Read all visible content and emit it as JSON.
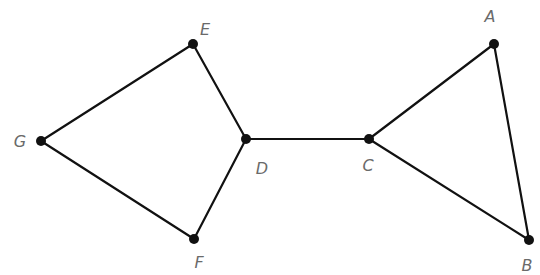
{
  "diagram": {
    "type": "graph",
    "nodes": [
      {
        "id": "A",
        "label": "A",
        "x": 494,
        "y": 44,
        "lx": 490,
        "ly": 22
      },
      {
        "id": "B",
        "label": "B",
        "x": 529,
        "y": 240,
        "lx": 527,
        "ly": 271
      },
      {
        "id": "C",
        "label": "C",
        "x": 369,
        "y": 139,
        "lx": 368,
        "ly": 171
      },
      {
        "id": "D",
        "label": "D",
        "x": 246,
        "y": 139,
        "lx": 262,
        "ly": 174
      },
      {
        "id": "E",
        "label": "E",
        "x": 193,
        "y": 44,
        "lx": 205,
        "ly": 35
      },
      {
        "id": "F",
        "label": "F",
        "x": 194,
        "y": 239,
        "lx": 199,
        "ly": 268
      },
      {
        "id": "G",
        "label": "G",
        "x": 41,
        "y": 141,
        "lx": 20,
        "ly": 147
      }
    ],
    "edges": [
      [
        "G",
        "E"
      ],
      [
        "E",
        "D"
      ],
      [
        "G",
        "F"
      ],
      [
        "F",
        "D"
      ],
      [
        "D",
        "C"
      ],
      [
        "C",
        "A"
      ],
      [
        "C",
        "B"
      ],
      [
        "A",
        "B"
      ]
    ]
  }
}
